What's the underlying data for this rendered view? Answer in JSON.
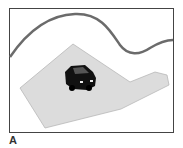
{
  "figure": {
    "panel_label": "A",
    "frame_color": "#444444",
    "road_color": "#6b6b6b",
    "area_fill": "#dcdcdc",
    "area_stroke": "#b8b8b8",
    "car_color": "#111111",
    "elements": [
      "curved-road-line",
      "shaded-area-polygon",
      "black-car-icon"
    ]
  }
}
